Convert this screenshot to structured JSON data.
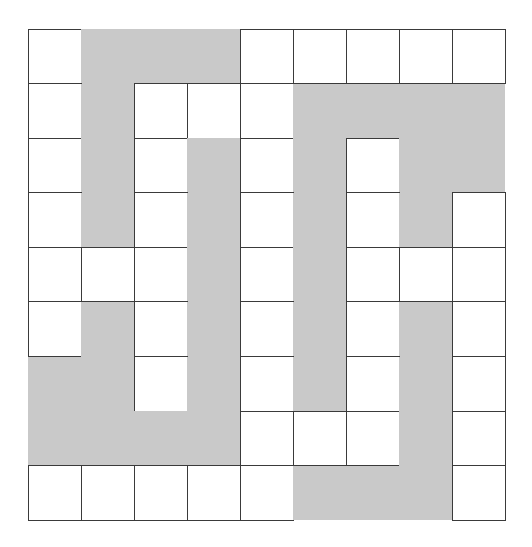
{
  "puzzle": {
    "type": "grid-path-diagram",
    "rows": 9,
    "cols": 9,
    "colors": {
      "white_cell": "#ffffff",
      "path_cell": "#c9c9c9",
      "border": "#3a3a3a"
    },
    "legend": "W = white square cell, G = gray shaded path cell",
    "grid": [
      [
        "W",
        "G",
        "G",
        "G",
        "W",
        "W",
        "W",
        "W",
        "W"
      ],
      [
        "W",
        "G",
        "W",
        "W",
        "W",
        "G",
        "G",
        "G",
        "G"
      ],
      [
        "W",
        "G",
        "W",
        "G",
        "W",
        "G",
        "W",
        "G",
        "G"
      ],
      [
        "W",
        "G",
        "W",
        "G",
        "W",
        "G",
        "W",
        "G",
        "W"
      ],
      [
        "W",
        "W",
        "W",
        "G",
        "W",
        "G",
        "W",
        "W",
        "W"
      ],
      [
        "W",
        "G",
        "W",
        "G",
        "W",
        "G",
        "W",
        "G",
        "W"
      ],
      [
        "G",
        "G",
        "W",
        "G",
        "W",
        "G",
        "W",
        "G",
        "W"
      ],
      [
        "G",
        "G",
        "G",
        "G",
        "W",
        "W",
        "W",
        "G",
        "W"
      ],
      [
        "W",
        "W",
        "W",
        "W",
        "W",
        "G",
        "G",
        "G",
        "W"
      ]
    ]
  }
}
